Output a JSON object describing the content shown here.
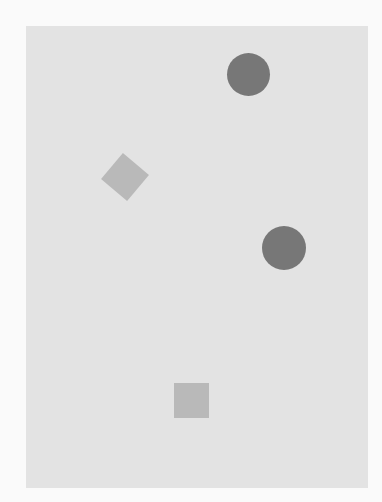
{
  "canvas": {
    "width": 382,
    "height": 502,
    "background": "#fafafa"
  },
  "panel": {
    "x": 26,
    "y": 26,
    "width": 342,
    "height": 462,
    "color": "#e3e3e3"
  },
  "shapes": [
    {
      "type": "circle",
      "cx": 248,
      "cy": 74,
      "size": 43,
      "color": "#777777",
      "rotation": 0
    },
    {
      "type": "square",
      "cx": 125,
      "cy": 177,
      "size": 34,
      "color": "#b9b9b9",
      "rotation": 40
    },
    {
      "type": "circle",
      "cx": 284,
      "cy": 248,
      "size": 44,
      "color": "#777777",
      "rotation": 0
    },
    {
      "type": "square",
      "cx": 191,
      "cy": 400,
      "size": 35,
      "color": "#b9b9b9",
      "rotation": 0
    }
  ]
}
